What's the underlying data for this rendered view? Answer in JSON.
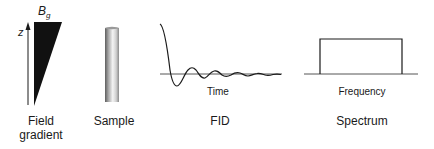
{
  "panels": {
    "field_gradient": {
      "symbol": "B",
      "symbol_subscript": "g",
      "axis_label": "z",
      "caption_line1": "Field",
      "caption_line2": "gradient"
    },
    "sample": {
      "caption": "Sample"
    },
    "fid": {
      "axis_label": "Time",
      "caption": "FID"
    },
    "spectrum": {
      "axis_label": "Frequency",
      "caption": "Spectrum"
    }
  },
  "colors": {
    "ink": "#1a1a1a",
    "baseline": "#555555",
    "sample_dark": "#6a6a6a",
    "sample_light": "#f2f2f2"
  }
}
